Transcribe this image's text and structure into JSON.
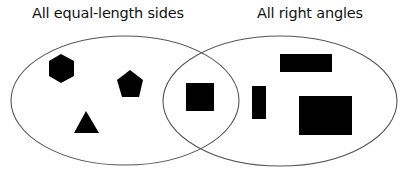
{
  "diagram": {
    "type": "venn",
    "sets": [
      {
        "label": "All equal-length sides",
        "shapes": [
          "hexagon",
          "pentagon",
          "triangle"
        ]
      },
      {
        "label": "All right angles",
        "shapes": [
          "thin-rectangle",
          "wide-rectangle",
          "large-rectangle"
        ]
      }
    ],
    "intersection": {
      "shapes": [
        "square"
      ]
    },
    "colors": {
      "outline": "#555555",
      "fill": "#000000",
      "background": "#ffffff"
    }
  }
}
